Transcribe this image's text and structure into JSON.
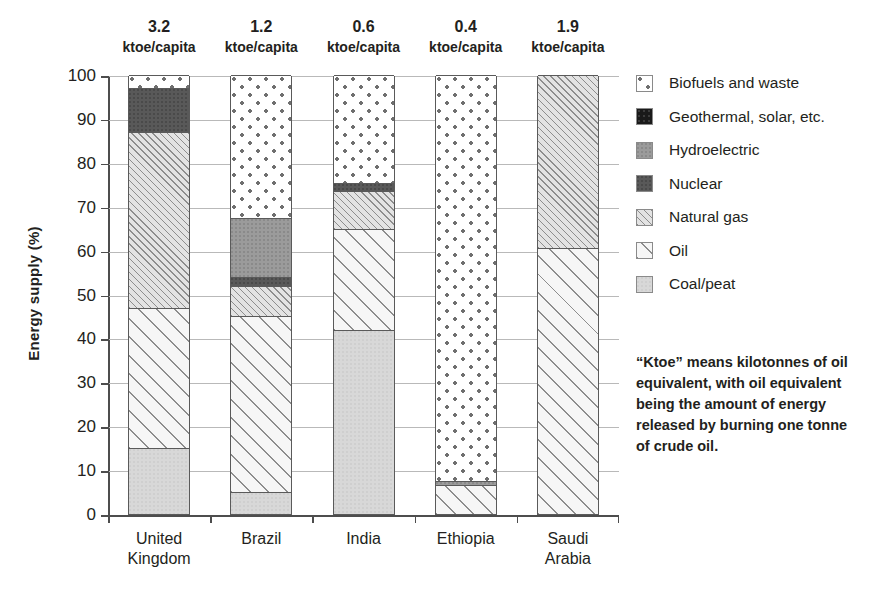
{
  "chart_data": {
    "type": "bar",
    "title": "",
    "xlabel": "",
    "ylabel": "Energy supply (%)",
    "ylim": [
      0,
      100
    ],
    "ytick_labels": [
      "0",
      "10",
      "20",
      "30",
      "40",
      "50",
      "60",
      "70",
      "80",
      "90",
      "100"
    ],
    "grid": true,
    "stacked": true,
    "legend_position": "right",
    "categories": [
      "United Kingdom",
      "Brazil",
      "India",
      "Ethiopia",
      "Saudi Arabia"
    ],
    "category_lines": [
      [
        "United",
        "Kingdom"
      ],
      [
        "Brazil"
      ],
      [
        "India"
      ],
      [
        "Ethiopia"
      ],
      [
        "Saudi",
        "Arabia"
      ]
    ],
    "top_annotations": [
      {
        "value": "3.2",
        "unit": "ktoe/capita"
      },
      {
        "value": "1.2",
        "unit": "ktoe/capita"
      },
      {
        "value": "0.6",
        "unit": "ktoe/capita"
      },
      {
        "value": "0.4",
        "unit": "ktoe/capita"
      },
      {
        "value": "1.9",
        "unit": "ktoe/capita"
      }
    ],
    "series": [
      {
        "name": "Biofuels and waste",
        "pattern": "p-biofuels",
        "values": [
          3.0,
          32.5,
          24.5,
          92.5,
          0.0
        ]
      },
      {
        "name": "Geothermal, solar, etc.",
        "pattern": "p-geothermal",
        "values": [
          0.0,
          0.0,
          0.0,
          0.0,
          0.0
        ]
      },
      {
        "name": "Hydroelectric",
        "pattern": "p-hydro",
        "values": [
          0.0,
          13.5,
          0.0,
          1.0,
          0.0
        ]
      },
      {
        "name": "Nuclear",
        "pattern": "p-nuclear",
        "values": [
          10.0,
          2.0,
          2.0,
          0.0,
          0.0
        ]
      },
      {
        "name": "Natural gas",
        "pattern": "p-gas",
        "values": [
          40.0,
          7.0,
          8.5,
          0.0,
          39.5
        ]
      },
      {
        "name": "Oil",
        "pattern": "p-oil",
        "values": [
          32.0,
          40.0,
          23.0,
          6.5,
          60.5
        ]
      },
      {
        "name": "Coal/peat",
        "pattern": "p-coal",
        "values": [
          15.0,
          5.0,
          42.0,
          0.0,
          0.0
        ]
      }
    ],
    "legend": [
      {
        "label": "Biofuels and waste",
        "pattern": "p-biofuels"
      },
      {
        "label": "Geothermal, solar, etc.",
        "pattern": "p-geothermal"
      },
      {
        "label": "Hydroelectric",
        "pattern": "p-hydro"
      },
      {
        "label": "Nuclear",
        "pattern": "p-nuclear"
      },
      {
        "label": "Natural gas",
        "pattern": "p-gas"
      },
      {
        "label": "Oil",
        "pattern": "p-oil"
      },
      {
        "label": "Coal/peat",
        "pattern": "p-coal"
      }
    ],
    "note": "“Ktoe” means kilotonnes of oil equivalent, with oil equivalent being the amount of energy released by burning one tonne of crude oil."
  }
}
